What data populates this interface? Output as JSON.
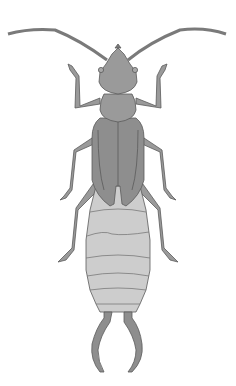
{
  "image": {
    "subject": "earwig",
    "description": "Dorsal-view grayscale illustration of an earwig with long antennae, six legs, wing covers, segmented abdomen, and curved pincers (cerci)."
  },
  "colors": {
    "background": "#ffffff",
    "body_dark": "#8e8e8e",
    "body_mid": "#9a9a9a",
    "abdomen_light": "#cdcdcd",
    "outline": "#5a5a5a"
  }
}
